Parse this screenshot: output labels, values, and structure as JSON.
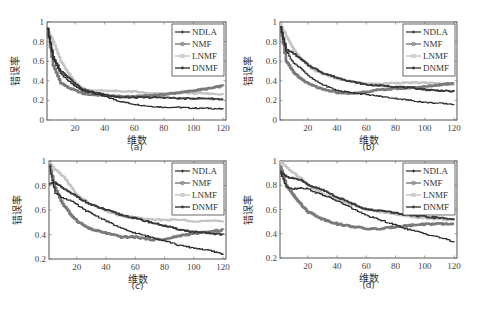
{
  "figure": {
    "captions": [
      "(a)",
      "(b)",
      "(c)",
      "(d)"
    ],
    "xlabel": "维数",
    "ylabel": "错误率"
  },
  "legend": {
    "entries": [
      "NDLA",
      "NMF",
      "LNMF",
      "DNMF"
    ]
  },
  "styles": {
    "NDLA": {
      "color": "#2a2a2a",
      "width": 1.2,
      "marker": "plus"
    },
    "NMF": {
      "color": "#7a7a7a",
      "width": 2.6,
      "marker": "circle"
    },
    "LNMF": {
      "color": "#c4c4c4",
      "width": 2.2,
      "marker": "square"
    },
    "DNMF": {
      "color": "#3a3a3a",
      "width": 1.8,
      "marker": "star"
    }
  },
  "chart_data": [
    {
      "type": "line",
      "title": "(a)",
      "xlabel": "维数",
      "ylabel": "错误率",
      "xlim": [
        1,
        122
      ],
      "ylim": [
        0,
        1
      ],
      "xticks": [
        20,
        40,
        60,
        80,
        100,
        120
      ],
      "yticks": [
        0,
        0.2,
        0.4,
        0.6,
        0.8,
        1
      ],
      "ytick_labels": [
        "0",
        "0.2",
        "0.4",
        "0.6",
        "0.8",
        "1"
      ],
      "legend_position": "upper right",
      "x": [
        1,
        5,
        10,
        15,
        20,
        25,
        30,
        40,
        50,
        60,
        70,
        80,
        90,
        100,
        110,
        120
      ],
      "series": [
        {
          "name": "NDLA",
          "values": [
            0.93,
            0.62,
            0.47,
            0.4,
            0.34,
            0.3,
            0.28,
            0.24,
            0.19,
            0.16,
            0.14,
            0.13,
            0.13,
            0.12,
            0.12,
            0.11
          ]
        },
        {
          "name": "NMF",
          "values": [
            0.93,
            0.55,
            0.38,
            0.33,
            0.3,
            0.27,
            0.26,
            0.25,
            0.24,
            0.24,
            0.25,
            0.26,
            0.28,
            0.3,
            0.32,
            0.35
          ]
        },
        {
          "name": "LNMF",
          "values": [
            0.93,
            0.8,
            0.6,
            0.48,
            0.38,
            0.32,
            0.3,
            0.3,
            0.29,
            0.29,
            0.27,
            0.27,
            0.28,
            0.27,
            0.27,
            0.26
          ]
        },
        {
          "name": "DNMF",
          "values": [
            0.93,
            0.64,
            0.5,
            0.44,
            0.37,
            0.31,
            0.29,
            0.26,
            0.23,
            0.23,
            0.23,
            0.23,
            0.22,
            0.22,
            0.22,
            0.21
          ]
        }
      ]
    },
    {
      "type": "line",
      "title": "(b)",
      "xlabel": "维数",
      "ylabel": "错误率",
      "xlim": [
        1,
        122
      ],
      "ylim": [
        0,
        1
      ],
      "xticks": [
        20,
        40,
        60,
        80,
        100,
        120
      ],
      "yticks": [
        0,
        0.2,
        0.4,
        0.6,
        0.8,
        1
      ],
      "ytick_labels": [
        "0",
        "0.2",
        "0.4",
        "0.6",
        "0.8",
        "1"
      ],
      "legend_position": "upper right",
      "x": [
        1,
        5,
        10,
        15,
        20,
        25,
        30,
        40,
        50,
        60,
        70,
        80,
        90,
        100,
        110,
        120
      ],
      "series": [
        {
          "name": "NDLA",
          "values": [
            0.95,
            0.7,
            0.58,
            0.53,
            0.45,
            0.4,
            0.36,
            0.3,
            0.28,
            0.26,
            0.24,
            0.22,
            0.2,
            0.18,
            0.17,
            0.16
          ]
        },
        {
          "name": "NMF",
          "values": [
            0.95,
            0.6,
            0.48,
            0.42,
            0.37,
            0.34,
            0.31,
            0.28,
            0.27,
            0.29,
            0.31,
            0.32,
            0.33,
            0.34,
            0.36,
            0.38
          ]
        },
        {
          "name": "LNMF",
          "values": [
            0.98,
            0.86,
            0.72,
            0.62,
            0.55,
            0.5,
            0.47,
            0.42,
            0.39,
            0.37,
            0.37,
            0.38,
            0.38,
            0.38,
            0.37,
            0.36
          ]
        },
        {
          "name": "DNMF",
          "values": [
            0.95,
            0.72,
            0.68,
            0.62,
            0.56,
            0.52,
            0.48,
            0.43,
            0.39,
            0.36,
            0.35,
            0.34,
            0.33,
            0.31,
            0.3,
            0.29
          ]
        }
      ]
    },
    {
      "type": "line",
      "title": "(c)",
      "xlabel": "维数",
      "ylabel": "错误率",
      "xlim": [
        1,
        122
      ],
      "ylim": [
        0.2,
        1
      ],
      "xticks": [
        20,
        40,
        60,
        80,
        100,
        120
      ],
      "yticks": [
        0.2,
        0.4,
        0.6,
        0.8,
        1
      ],
      "ytick_labels": [
        "0.2",
        "0.4",
        "0.6",
        "0.8",
        "1"
      ],
      "legend_position": "upper right",
      "x": [
        1,
        5,
        10,
        15,
        20,
        25,
        30,
        40,
        50,
        60,
        70,
        80,
        90,
        100,
        110,
        120
      ],
      "series": [
        {
          "name": "NDLA",
          "values": [
            0.95,
            0.74,
            0.7,
            0.68,
            0.64,
            0.6,
            0.57,
            0.51,
            0.45,
            0.41,
            0.38,
            0.35,
            0.31,
            0.29,
            0.27,
            0.24
          ]
        },
        {
          "name": "NMF",
          "values": [
            0.97,
            0.78,
            0.65,
            0.57,
            0.51,
            0.47,
            0.44,
            0.41,
            0.38,
            0.38,
            0.36,
            0.36,
            0.39,
            0.41,
            0.42,
            0.44
          ]
        },
        {
          "name": "LNMF",
          "values": [
            0.98,
            0.93,
            0.88,
            0.8,
            0.72,
            0.68,
            0.64,
            0.59,
            0.55,
            0.54,
            0.52,
            0.52,
            0.52,
            0.51,
            0.51,
            0.51
          ]
        },
        {
          "name": "DNMF",
          "values": [
            0.82,
            0.82,
            0.78,
            0.74,
            0.71,
            0.67,
            0.64,
            0.6,
            0.56,
            0.53,
            0.5,
            0.47,
            0.44,
            0.42,
            0.41,
            0.4
          ]
        }
      ]
    },
    {
      "type": "line",
      "title": "(d)",
      "xlabel": "维数",
      "ylabel": "错误率",
      "xlim": [
        1,
        122
      ],
      "ylim": [
        0.2,
        1
      ],
      "xticks": [
        20,
        40,
        60,
        80,
        100,
        120
      ],
      "yticks": [
        0.2,
        0.4,
        0.6,
        0.8,
        1
      ],
      "ytick_labels": [
        "0.2",
        "0.4",
        "0.6",
        "0.8",
        "1"
      ],
      "legend_position": "upper right",
      "x": [
        1,
        5,
        10,
        15,
        20,
        25,
        30,
        40,
        50,
        60,
        70,
        80,
        90,
        100,
        110,
        120
      ],
      "series": [
        {
          "name": "NDLA",
          "values": [
            0.9,
            0.79,
            0.77,
            0.78,
            0.77,
            0.74,
            0.72,
            0.67,
            0.61,
            0.55,
            0.51,
            0.47,
            0.43,
            0.4,
            0.37,
            0.33
          ]
        },
        {
          "name": "NMF",
          "values": [
            0.95,
            0.8,
            0.72,
            0.64,
            0.58,
            0.55,
            0.52,
            0.48,
            0.46,
            0.44,
            0.44,
            0.46,
            0.47,
            0.48,
            0.48,
            0.48
          ]
        },
        {
          "name": "LNMF",
          "values": [
            0.99,
            0.95,
            0.9,
            0.86,
            0.8,
            0.76,
            0.73,
            0.68,
            0.64,
            0.6,
            0.58,
            0.56,
            0.54,
            0.53,
            0.52,
            0.51
          ]
        },
        {
          "name": "DNMF",
          "values": [
            0.92,
            0.87,
            0.86,
            0.84,
            0.8,
            0.78,
            0.76,
            0.7,
            0.65,
            0.6,
            0.59,
            0.57,
            0.55,
            0.54,
            0.53,
            0.52
          ]
        }
      ]
    }
  ]
}
